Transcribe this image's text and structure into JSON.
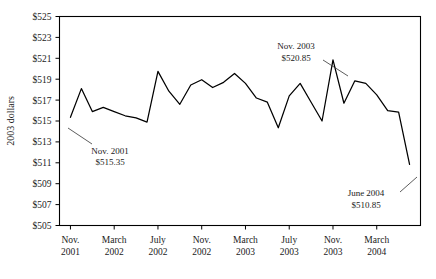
{
  "chart_data": {
    "type": "line",
    "title": "",
    "subtitle": "",
    "xlabel": "",
    "ylabel": "2003 dollars",
    "ylim": [
      505,
      525
    ],
    "ytick_step": 2,
    "ytick_labels": [
      "$525",
      "$523",
      "$521",
      "$519",
      "$517",
      "$515",
      "$513",
      "$511",
      "$509",
      "$507",
      "$505"
    ],
    "ytick_values": [
      525,
      523,
      521,
      519,
      517,
      515,
      513,
      511,
      509,
      507,
      505
    ],
    "xtick_labels_line1": [
      "Nov.",
      "March",
      "July",
      "Nov.",
      "March",
      "July",
      "Nov.",
      "March"
    ],
    "xtick_labels_line2": [
      "2001",
      "2002",
      "2002",
      "2002",
      "2003",
      "2003",
      "2003",
      "2004"
    ],
    "xtick_values": [
      "Nov. 2001",
      "March 2002",
      "July 2002",
      "Nov. 2002",
      "March 2003",
      "July 2003",
      "Nov. 2003",
      "March 2004"
    ],
    "grid": false,
    "legend": "none",
    "line_color": "#000000",
    "series": [
      {
        "name": "2003 dollars",
        "x": [
          "Nov. 2001",
          "Dec. 2001",
          "Jan. 2002",
          "Feb. 2002",
          "March 2002",
          "April 2002",
          "May 2002",
          "June 2002",
          "July 2002",
          "Aug. 2002",
          "Sept. 2002",
          "Oct. 2002",
          "Nov. 2002",
          "Dec. 2002",
          "Jan. 2003",
          "Feb. 2003",
          "March 2003",
          "April 2003",
          "May 2003",
          "June 2003",
          "July 2003",
          "Aug. 2003",
          "Sept. 2003",
          "Oct. 2003",
          "Nov. 2003",
          "Dec. 2003",
          "Jan. 2004",
          "Feb. 2004",
          "March 2004",
          "April 2004",
          "May 2004",
          "June 2004"
        ],
        "values": [
          515.35,
          518.1,
          515.9,
          516.3,
          515.9,
          515.5,
          515.3,
          514.9,
          519.75,
          517.85,
          516.6,
          518.45,
          518.95,
          518.2,
          518.7,
          519.55,
          518.6,
          517.2,
          516.8,
          514.35,
          517.4,
          518.6,
          516.8,
          515.0,
          520.85,
          516.7,
          518.85,
          518.6,
          517.5,
          516.0,
          515.85,
          510.85
        ]
      }
    ],
    "annotations": [
      {
        "name": "nov-2001",
        "label": "Nov. 2001",
        "value": "$515.35",
        "points_to": "Nov. 2001"
      },
      {
        "name": "nov-2003",
        "label": "Nov. 2003",
        "value": "$520.85",
        "points_to": "Nov. 2003"
      },
      {
        "name": "june-2004",
        "label": "June 2004",
        "value": "$510.85",
        "points_to": "June 2004"
      }
    ]
  },
  "axis": {
    "y_title": "2003 dollars",
    "y_ticks": [
      "$525",
      "$523",
      "$521",
      "$519",
      "$517",
      "$515",
      "$513",
      "$511",
      "$509",
      "$507",
      "$505"
    ],
    "x_ticks": [
      {
        "month": "Nov.",
        "year": "2001"
      },
      {
        "month": "March",
        "year": "2002"
      },
      {
        "month": "July",
        "year": "2002"
      },
      {
        "month": "Nov.",
        "year": "2002"
      },
      {
        "month": "March",
        "year": "2003"
      },
      {
        "month": "July",
        "year": "2003"
      },
      {
        "month": "Nov.",
        "year": "2003"
      },
      {
        "month": "March",
        "year": "2004"
      }
    ]
  },
  "annotations": {
    "a1": {
      "line1": "Nov. 2001",
      "line2": "$515.35"
    },
    "a2": {
      "line1": "Nov. 2003",
      "line2": "$520.85"
    },
    "a3": {
      "line1": "June 2004",
      "line2": "$510.85"
    }
  },
  "colors": {
    "line": "#000000",
    "frame": "#000000",
    "text": "#1a1a1a",
    "background": "#ffffff"
  }
}
